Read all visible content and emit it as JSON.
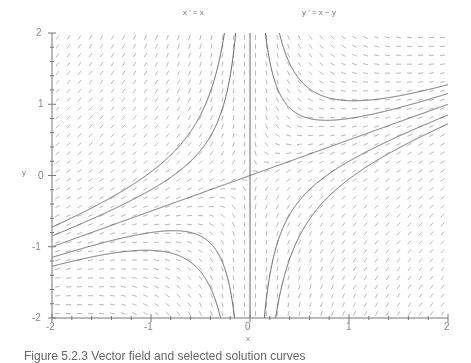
{
  "chart_data": {
    "type": "line",
    "subtype": "phase-portrait-direction-field",
    "equations": [
      "x ' = x",
      "y ' = x − y"
    ],
    "xlabel": "x",
    "ylabel": "y",
    "xlim": [
      -2,
      2
    ],
    "ylim": [
      -2,
      2
    ],
    "x_ticks": [
      "-2",
      "-1",
      "0",
      "1",
      "2"
    ],
    "y_ticks": [
      "2",
      "1",
      "0",
      "-1",
      "-2"
    ],
    "grid": false,
    "legend": null,
    "direction_field": {
      "nx": 36,
      "ny": 32,
      "segment_length_px": 5,
      "color": "#9a9a9a"
    },
    "trajectories": {
      "family": "y = x/2 + k/x",
      "k_values": [
        -0.55,
        -0.3,
        0,
        0.3,
        0.55
      ],
      "extra_vertical_line": "x = 0",
      "color": "#555555"
    }
  },
  "caption": "Figure 5.2.3   Vector field and selected solution curves"
}
